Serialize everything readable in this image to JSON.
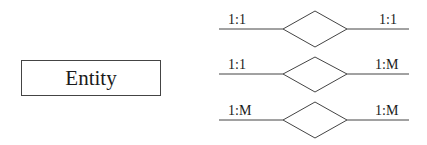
{
  "entity": {
    "label": "Entity"
  },
  "relationships": [
    {
      "left_label": "1:1",
      "right_label": "1:1"
    },
    {
      "left_label": "1:1",
      "right_label": "1:M"
    },
    {
      "left_label": "1:M",
      "right_label": "1:M"
    }
  ]
}
